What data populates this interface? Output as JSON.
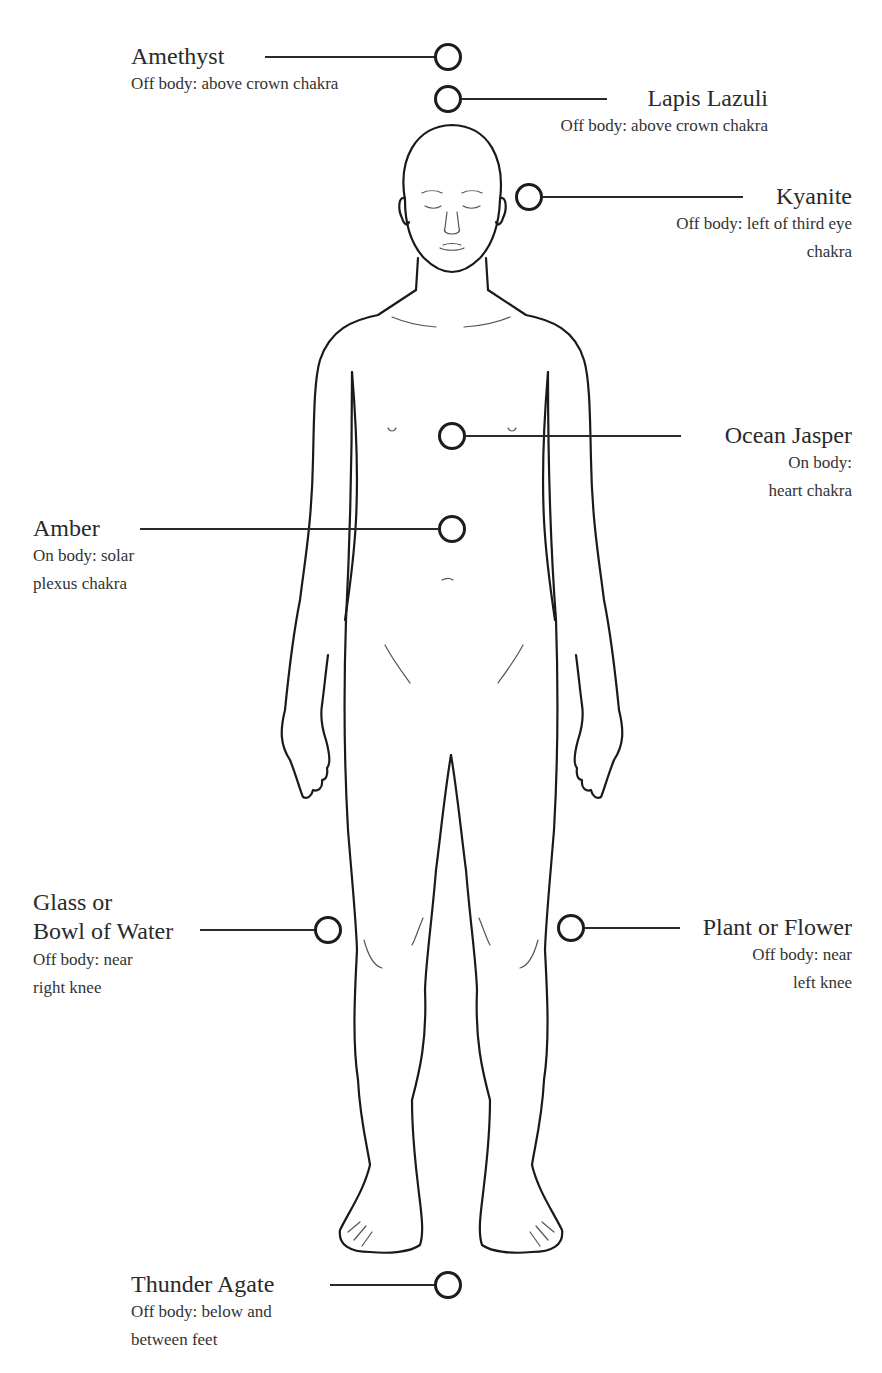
{
  "diagram": {
    "marker_color": "#1c1c1c",
    "line_color": "#2a2a2a",
    "placements": [
      {
        "id": "amethyst",
        "name": "Amethyst",
        "desc_lines": [
          "Off body: above crown chakra"
        ]
      },
      {
        "id": "lapis-lazuli",
        "name": "Lapis Lazuli",
        "desc_lines": [
          "Off body: above crown chakra"
        ]
      },
      {
        "id": "kyanite",
        "name": "Kyanite",
        "desc_lines": [
          "Off body: left of third eye",
          "chakra"
        ]
      },
      {
        "id": "ocean-jasper",
        "name": "Ocean Jasper",
        "desc_lines": [
          "On body:",
          "heart chakra"
        ]
      },
      {
        "id": "amber",
        "name": "Amber",
        "desc_lines": [
          "On body: solar",
          "plexus chakra"
        ]
      },
      {
        "id": "glass-water",
        "name_lines": [
          "Glass or",
          "Bowl of Water"
        ],
        "desc_lines": [
          "Off body: near",
          "right knee"
        ]
      },
      {
        "id": "plant-flower",
        "name": "Plant or Flower",
        "desc_lines": [
          "Off body: near",
          "left knee"
        ]
      },
      {
        "id": "thunder-agate",
        "name": "Thunder Agate",
        "desc_lines": [
          "Off body: below and",
          "between feet"
        ]
      }
    ]
  }
}
